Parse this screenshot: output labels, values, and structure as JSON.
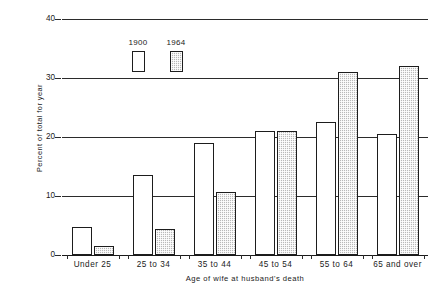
{
  "chart_data": {
    "type": "bar",
    "title": "",
    "subtitle": "",
    "xlabel": "Age of wife at husband's death",
    "ylabel": "Percent of total for year",
    "categories": [
      "Under 25",
      "25 to 34",
      "35 to 44",
      "45 to 54",
      "55 to 64",
      "65 and over"
    ],
    "series": [
      {
        "name": "1900",
        "values": [
          4.7,
          13.5,
          19.0,
          21.0,
          22.5,
          20.5
        ],
        "style": "open-white"
      },
      {
        "name": "1964",
        "values": [
          1.5,
          4.4,
          10.6,
          21.0,
          31.0,
          32.0
        ],
        "style": "shaded-gray"
      }
    ],
    "ylim": [
      0,
      40
    ],
    "yticks": [
      0,
      10,
      20,
      30,
      40
    ],
    "ytick_labels": [
      "0",
      "10",
      "20",
      "30",
      "40"
    ],
    "grid": "horizontal",
    "legend_position": "inside-top-left",
    "colors": {
      "series_1900": "#ffffff",
      "series_1964": "#b9b9b9",
      "outline": "#1d1d1d",
      "grid": "#2b2b2b",
      "background": "#ffffff"
    }
  },
  "legend": {
    "entries": [
      {
        "label": "1900"
      },
      {
        "label": "1964"
      }
    ]
  }
}
